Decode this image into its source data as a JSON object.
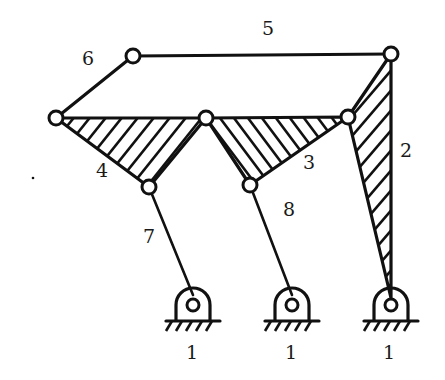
{
  "diagram": {
    "type": "planar linkage mechanism",
    "colors": {
      "line": "#111111",
      "background": "#ffffff"
    },
    "link_labels": {
      "ground_a": "1",
      "ground_b": "1",
      "ground_c": "1",
      "link_2": "2",
      "link_3": "3",
      "link_4": "4",
      "link_5": "5",
      "link_6": "6",
      "link_7": "7",
      "link_8": "8"
    },
    "links": [
      {
        "id": "1",
        "desc": "ground (three fixed pivot supports)"
      },
      {
        "id": "2",
        "desc": "hatched ternary link, right side, pivoted to ground"
      },
      {
        "id": "3",
        "desc": "hatched triangular link, center-right"
      },
      {
        "id": "4",
        "desc": "hatched triangular link, center-left"
      },
      {
        "id": "5",
        "desc": "long horizontal binary link, top"
      },
      {
        "id": "6",
        "desc": "short binary link, top-left"
      },
      {
        "id": "7",
        "desc": "crank/rocker from left ground pivot"
      },
      {
        "id": "8",
        "desc": "crank/rocker from middle ground pivot"
      }
    ]
  }
}
